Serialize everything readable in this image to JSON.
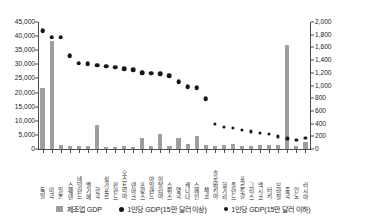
{
  "topband": {
    "clipped_text": "ᅟ  ᅟ  ᅟ  ᅟ  ᅟ  ᅟ  ᅟ  ᅟ  ᅟ  ᅟ  ᅟ  ᅟ  ᅟ  ᅟ  ᅟ"
  },
  "legend": {
    "items": [
      {
        "label": "제조업 GDP",
        "marker": "bar-swatch",
        "color": "#9e9e9e"
      },
      {
        "label": "1인당 GDP(15만 달러 이상)",
        "marker": "dot-large",
        "color": "#161616"
      },
      {
        "label": "1인당 GDP(15만 달러 이하)",
        "marker": "dot-small",
        "color": "#161616"
      }
    ]
  },
  "chart_data": {
    "type": "bar",
    "title": "",
    "subtitle": "",
    "xlabel": "",
    "ylabel": "",
    "grid": false,
    "legend_position": "bottom",
    "axes": {
      "left": {
        "name": "제조업 GDP",
        "ylim": [
          0,
          45000
        ],
        "ticks": [
          0,
          5000,
          10000,
          15000,
          20000,
          25000,
          30000,
          35000,
          40000,
          45000
        ],
        "tick_labels": [
          "0",
          "5,000",
          "10,000",
          "15,000",
          "20,000",
          "25,000",
          "30,000",
          "35,000",
          "40,000",
          "45,000"
        ]
      },
      "right": {
        "name": "1인당 GDP",
        "ylim": [
          0,
          2000
        ],
        "ticks": [
          0,
          200,
          400,
          600,
          800,
          1000,
          1200,
          1400,
          1600,
          1800,
          2000
        ],
        "tick_labels": [
          "0",
          "200",
          "400",
          "600",
          "800",
          "1,000",
          "1,200",
          "1,400",
          "1,600",
          "1,800",
          "2,000"
        ]
      }
    },
    "categories": [
      "독일",
      "미국",
      "일본",
      "스웨덴",
      "네덜란드",
      "벨기에",
      "한국",
      "싱가포르",
      "핀란드",
      "오스트리아",
      "덴마크",
      "프랑스",
      "아일랜드",
      "이탈리아",
      "스위스",
      "영국",
      "캐나다",
      "스페인",
      "체코",
      "슬로바키아",
      "헝가리",
      "폴란드",
      "포르투갈",
      "그리스",
      "멕시코",
      "터키",
      "브라질",
      "중국",
      "인도",
      "러시아"
    ],
    "series": [
      {
        "name": "제조업 GDP",
        "axis": "left",
        "type": "bar",
        "color": "#9e9e9e",
        "values": [
          21500,
          38400,
          1500,
          1050,
          1100,
          900,
          8600,
          850,
          800,
          1000,
          750,
          3800,
          900,
          5400,
          1150,
          3900,
          1750,
          4600,
          1500,
          1050,
          1350,
          1900,
          1000,
          900,
          1500,
          1250,
          1400,
          37000,
          1150,
          2400
        ]
      },
      {
        "name": "1인당 GDP(15만 달러 이상)",
        "axis": "right",
        "type": "scatter",
        "marker_size": "large",
        "color": "#161616",
        "values": [
          1860,
          1760,
          1760,
          1465,
          1350,
          1345,
          1320,
          1300,
          1285,
          1265,
          1245,
          1200,
          1190,
          1185,
          1155,
          1060,
          980,
          965,
          790,
          null,
          null,
          null,
          null,
          null,
          null,
          null,
          null,
          null,
          null,
          null
        ]
      },
      {
        "name": "1인당 GDP(15만 달러 이하)",
        "axis": "right",
        "type": "scatter",
        "marker_size": "small",
        "color": "#161616",
        "values": [
          null,
          null,
          null,
          null,
          null,
          null,
          null,
          null,
          null,
          null,
          null,
          null,
          null,
          null,
          null,
          null,
          null,
          null,
          null,
          395,
          350,
          330,
          300,
          275,
          250,
          235,
          195,
          165,
          140,
          175
        ]
      }
    ]
  }
}
